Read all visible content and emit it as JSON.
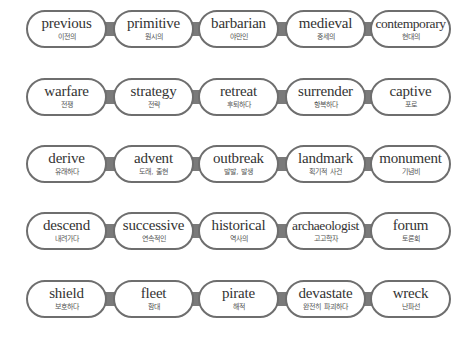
{
  "rows": [
    [
      {
        "en": "previous",
        "ko": "이전의"
      },
      {
        "en": "primitive",
        "ko": "원시의"
      },
      {
        "en": "barbarian",
        "ko": "야만인"
      },
      {
        "en": "medieval",
        "ko": "중세의"
      },
      {
        "en": "contemporary",
        "ko": "현대의"
      }
    ],
    [
      {
        "en": "warfare",
        "ko": "전쟁"
      },
      {
        "en": "strategy",
        "ko": "전략"
      },
      {
        "en": "retreat",
        "ko": "후퇴하다"
      },
      {
        "en": "surrender",
        "ko": "항복하다"
      },
      {
        "en": "captive",
        "ko": "포로"
      }
    ],
    [
      {
        "en": "derive",
        "ko": "유래하다"
      },
      {
        "en": "advent",
        "ko": "도래, 출현"
      },
      {
        "en": "outbreak",
        "ko": "발발, 발생"
      },
      {
        "en": "landmark",
        "ko": "획기적 사건"
      },
      {
        "en": "monument",
        "ko": "기념비"
      }
    ],
    [
      {
        "en": "descend",
        "ko": "내려가다"
      },
      {
        "en": "successive",
        "ko": "연속적인"
      },
      {
        "en": "historical",
        "ko": "역사의"
      },
      {
        "en": "archaeologist",
        "ko": "고고학자"
      },
      {
        "en": "forum",
        "ko": "토론회"
      }
    ],
    [
      {
        "en": "shield",
        "ko": "보호하다"
      },
      {
        "en": "fleet",
        "ko": "함대"
      },
      {
        "en": "pirate",
        "ko": "해적"
      },
      {
        "en": "devastate",
        "ko": "완전히 파괴하다"
      },
      {
        "en": "wreck",
        "ko": "난파선"
      }
    ]
  ],
  "colors": {
    "border": "#6e6e6e",
    "connector": "#7a7a7a",
    "text": "#333333"
  }
}
